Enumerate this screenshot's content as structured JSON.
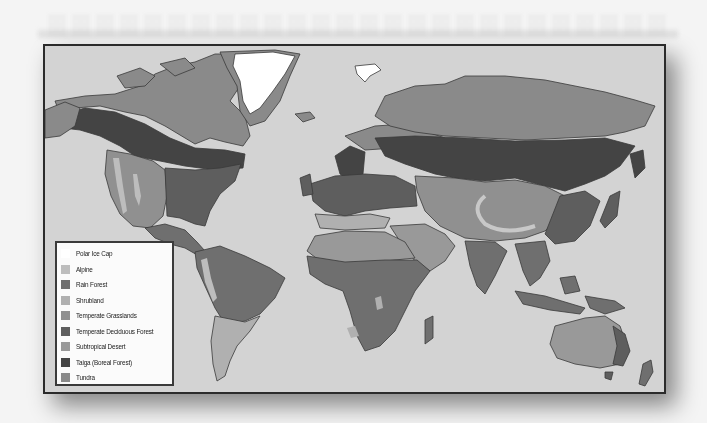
{
  "map": {
    "title": "World Biomes",
    "ocean_color": "#d3d3d3",
    "border_color": "#2b2b2b"
  },
  "legend": {
    "items": [
      {
        "label": "Polar Ice Cap",
        "color": "#ffffff"
      },
      {
        "label": "Alpine",
        "color": "#bdbdbd"
      },
      {
        "label": "Rain Forest",
        "color": "#6f6f6f"
      },
      {
        "label": "Shrubland",
        "color": "#b0b0b0"
      },
      {
        "label": "Temperate Grasslands",
        "color": "#909090"
      },
      {
        "label": "Temperate Deciduous Forest",
        "color": "#5e5e5e"
      },
      {
        "label": "Subtropical Desert",
        "color": "#999999"
      },
      {
        "label": "Taiga (Boreal Forest)",
        "color": "#444444"
      },
      {
        "label": "Tundra",
        "color": "#8a8a8a"
      }
    ]
  }
}
